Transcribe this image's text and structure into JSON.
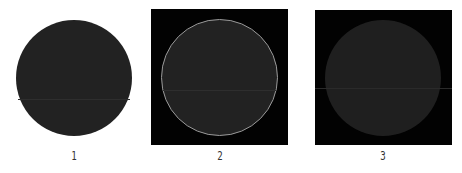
{
  "panels": [
    {
      "label": "1",
      "background": "#ffffff",
      "circle_fill": "#222222",
      "circle_outline": "none"
    },
    {
      "label": "2",
      "background": "#020202",
      "circle_fill": "#222222",
      "circle_outline": "#9a9a9a"
    },
    {
      "label": "3",
      "background": "#020202",
      "circle_fill": "#1f1f1f",
      "circle_outline": "none"
    }
  ]
}
